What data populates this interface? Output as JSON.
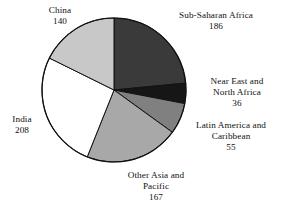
{
  "chart_data": {
    "type": "pie",
    "title": "",
    "subtitle": "",
    "xlabel": "",
    "ylabel": "",
    "total": 792,
    "units": "millions",
    "legend_position": "none",
    "labels_outside": true,
    "grid": false,
    "start_angle_deg": 0,
    "direction": "clockwise",
    "categories": [
      "Sub-Saharan Africa",
      "Near East and North Africa",
      "Latin America and Caribbean",
      "Other Asia and Pacific",
      "India",
      "China"
    ],
    "values": [
      186,
      36,
      55,
      167,
      208,
      140
    ],
    "colors": [
      "#3a3a3a",
      "#161616",
      "#808080",
      "#a8a8a8",
      "#ffffff",
      "#c8c8c8"
    ],
    "slices": [
      {
        "name": "Sub-Saharan Africa",
        "value": 186,
        "color": "#3a3a3a",
        "start_deg": 0.0,
        "sweep_deg": 84.5,
        "label_lines": [
          "Sub-Saharan Africa"
        ],
        "value_text": "186"
      },
      {
        "name": "Near East and North Africa",
        "value": 36,
        "color": "#161616",
        "start_deg": 84.5,
        "sweep_deg": 16.4,
        "label_lines": [
          "Near East and",
          "North Africa"
        ],
        "value_text": "36"
      },
      {
        "name": "Latin America and Caribbean",
        "value": 55,
        "color": "#808080",
        "start_deg": 100.9,
        "sweep_deg": 25.0,
        "label_lines": [
          "Latin America and",
          "Caribbean"
        ],
        "value_text": "55"
      },
      {
        "name": "Other Asia and Pacific",
        "value": 167,
        "color": "#a8a8a8",
        "start_deg": 125.9,
        "sweep_deg": 75.9,
        "label_lines": [
          "Other Asia and",
          "Pacific"
        ],
        "value_text": "167"
      },
      {
        "name": "India",
        "value": 208,
        "color": "#ffffff",
        "start_deg": 201.8,
        "sweep_deg": 94.5,
        "label_lines": [
          "India"
        ],
        "value_text": "208"
      },
      {
        "name": "China",
        "value": 140,
        "color": "#c8c8c8",
        "start_deg": 296.3,
        "sweep_deg": 63.7,
        "label_lines": [
          "China"
        ],
        "value_text": "140"
      }
    ]
  },
  "labels": {
    "sub_saharan_africa": {
      "line1": "Sub-Saharan Africa",
      "value": "186"
    },
    "near_east_north_africa": {
      "line1": "Near East and",
      "line2": "North Africa",
      "value": "36"
    },
    "latin_america_caribbean": {
      "line1": "Latin America and",
      "line2": "Caribbean",
      "value": "55"
    },
    "other_asia_pacific": {
      "line1": "Other Asia and",
      "line2": "Pacific",
      "value": "167"
    },
    "india": {
      "line1": "India",
      "value": "208"
    },
    "china": {
      "line1": "China",
      "value": "140"
    }
  },
  "style": {
    "stroke_color": "#111111",
    "background": "#ffffff"
  }
}
